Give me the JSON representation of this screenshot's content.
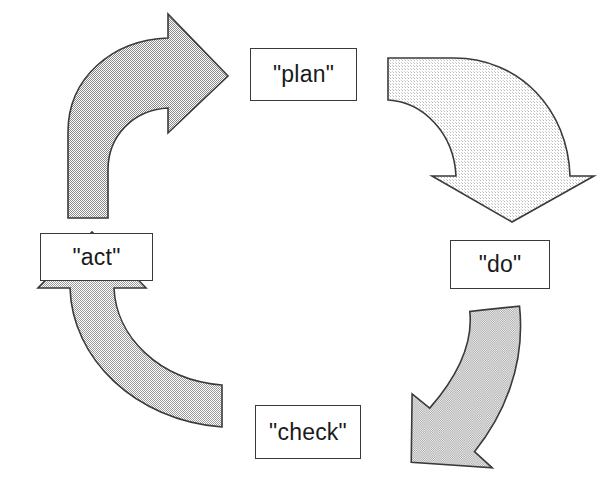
{
  "diagram": {
    "background_color": "#ffffff",
    "width": 604,
    "height": 494,
    "outline_color": "#3a3a3a",
    "text_color": "#1a1a1a"
  },
  "nodes": [
    {
      "id": "plan",
      "label": "\"plan\"",
      "position": "top"
    },
    {
      "id": "do",
      "label": "\"do\"",
      "position": "right"
    },
    {
      "id": "check",
      "label": "\"check\"",
      "position": "bottom"
    },
    {
      "id": "act",
      "label": "\"act\"",
      "position": "left"
    }
  ],
  "arrows": [
    {
      "id": "act-to-plan",
      "from": "act",
      "to": "plan",
      "direction": "up-right",
      "fill_color": "#c9c9c9",
      "fill_density": "medium",
      "stroke_color": "#3a3a3a"
    },
    {
      "id": "plan-to-do",
      "from": "plan",
      "to": "do",
      "direction": "right-down",
      "fill_color": "#ededed",
      "fill_density": "light",
      "stroke_color": "#3a3a3a"
    },
    {
      "id": "do-to-check",
      "from": "do",
      "to": "check",
      "direction": "down-left",
      "fill_color": "#d8d8d8",
      "fill_density": "medium",
      "stroke_color": "#3a3a3a"
    },
    {
      "id": "check-to-act",
      "from": "check",
      "to": "act",
      "direction": "left-up",
      "fill_color": "#cccccc",
      "fill_density": "medium",
      "stroke_color": "#3a3a3a"
    }
  ]
}
